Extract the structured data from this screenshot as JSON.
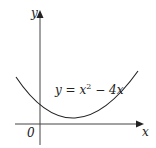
{
  "diagram": {
    "axes": {
      "x_label": "x",
      "y_label": "y",
      "origin_label": "0"
    },
    "curve": {
      "equation_lhs": "y = x",
      "exponent": "2",
      "equation_rhs": " − 4x",
      "full_equation": "y = x^2 − 4x",
      "roots": [
        0,
        4
      ],
      "vertex": [
        2,
        -4
      ]
    },
    "colors": {
      "axis": "#333333",
      "curve": "#222222",
      "background": "#ffffff"
    }
  }
}
